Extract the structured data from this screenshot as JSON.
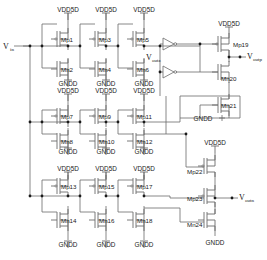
{
  "figure": {
    "type": "circuit-schematic",
    "line_color": "#6b6b6b",
    "text_color": "#1a1a1a",
    "background": "#ffffff"
  },
  "ports": {
    "input": {
      "base": "V",
      "sub": "in",
      "full": "Vin"
    },
    "out_z": {
      "base": "V",
      "sub": "outz",
      "full": "Voutz"
    },
    "out_p": {
      "base": "V",
      "sub": "outp",
      "full": "Voutp"
    },
    "out_n": {
      "base": "V",
      "sub": "outn",
      "full": "Voutn"
    }
  },
  "rails": {
    "supply": "VDD5D",
    "ground": "GNDD"
  },
  "rail_labels": {
    "vdd": [
      {
        "id": "vdd-r1c1",
        "text": "VDD5D",
        "x": 54,
        "y": 17
      },
      {
        "id": "vdd-r1c2",
        "text": "VDD5D",
        "x": 92,
        "y": 17
      },
      {
        "id": "vdd-r1c3",
        "text": "VDD5D",
        "x": 130,
        "y": 17
      },
      {
        "id": "vdd-r2c1",
        "text": "VDD5D",
        "x": 54,
        "y": 98
      },
      {
        "id": "vdd-r2c2",
        "text": "VDD5D",
        "x": 92,
        "y": 98
      },
      {
        "id": "vdd-r2c3",
        "text": "VDD5D",
        "x": 130,
        "y": 98
      },
      {
        "id": "vdd-r3c1",
        "text": "VDD5D",
        "x": 54,
        "y": 165
      },
      {
        "id": "vdd-r3c2",
        "text": "VDD5D",
        "x": 92,
        "y": 165
      },
      {
        "id": "vdd-r3c3",
        "text": "VDD5D",
        "x": 130,
        "y": 165
      },
      {
        "id": "vdd-out1",
        "text": "VDD5D",
        "x": 225,
        "y": 27
      },
      {
        "id": "vdd-out2",
        "text": "VDD5D",
        "x": 225,
        "y": 146
      }
    ],
    "gnd": [
      {
        "id": "gnd-r1c1",
        "text": "GNDD",
        "x": 55,
        "y": 87
      },
      {
        "id": "gnd-r1c2",
        "text": "GNDD",
        "x": 93,
        "y": 87
      },
      {
        "id": "gnd-r1c3",
        "text": "GNDD",
        "x": 131,
        "y": 87
      },
      {
        "id": "gnd-r2c1",
        "text": "GNDD",
        "x": 55,
        "y": 155
      },
      {
        "id": "gnd-r2c2",
        "text": "GNDD",
        "x": 93,
        "y": 155
      },
      {
        "id": "gnd-r2c3",
        "text": "GNDD",
        "x": 131,
        "y": 155
      },
      {
        "id": "gnd-r3c1",
        "text": "GNDD",
        "x": 55,
        "y": 248
      },
      {
        "id": "gnd-r3c2",
        "text": "GNDD",
        "x": 93,
        "y": 248
      },
      {
        "id": "gnd-r3c3",
        "text": "GNDD",
        "x": 131,
        "y": 248
      },
      {
        "id": "gnd-out1",
        "text": "GNDD",
        "x": 204,
        "y": 120
      },
      {
        "id": "gnd-out2",
        "text": "GNDD",
        "x": 221,
        "y": 234
      }
    ]
  },
  "transistors": [
    {
      "id": "Mp1",
      "label": "Mp1",
      "type": "pmos",
      "lx": 61,
      "ly": 40
    },
    {
      "id": "Mn2",
      "label": "Mn2",
      "type": "nmos",
      "lx": 61,
      "ly": 70
    },
    {
      "id": "Mp3",
      "label": "Mp3",
      "type": "pmos",
      "lx": 99,
      "ly": 40
    },
    {
      "id": "Mn4",
      "label": "Mn4",
      "type": "nmos",
      "lx": 99,
      "ly": 70
    },
    {
      "id": "Mp5",
      "label": "Mp5",
      "type": "pmos",
      "lx": 137,
      "ly": 40
    },
    {
      "id": "Mn6",
      "label": "Mn6",
      "type": "nmos",
      "lx": 137,
      "ly": 70
    },
    {
      "id": "Mp7",
      "label": "Mp7",
      "type": "pmos",
      "lx": 61,
      "ly": 118
    },
    {
      "id": "Mn8",
      "label": "Mn8",
      "type": "nmos",
      "lx": 61,
      "ly": 142
    },
    {
      "id": "Mp9",
      "label": "Mp9",
      "type": "pmos",
      "lx": 99,
      "ly": 118
    },
    {
      "id": "Mn10",
      "label": "Mn10",
      "type": "nmos",
      "lx": 99,
      "ly": 142
    },
    {
      "id": "Mp11",
      "label": "Mp11",
      "type": "pmos",
      "lx": 137,
      "ly": 118
    },
    {
      "id": "Mn12",
      "label": "Mn12",
      "type": "nmos",
      "lx": 137,
      "ly": 142
    },
    {
      "id": "Mp13",
      "label": "Mp13",
      "type": "pmos",
      "lx": 61,
      "ly": 188
    },
    {
      "id": "Mn14",
      "label": "Mn14",
      "type": "nmos",
      "lx": 61,
      "ly": 222
    },
    {
      "id": "Mp15",
      "label": "Mp15",
      "type": "pmos",
      "lx": 99,
      "ly": 188
    },
    {
      "id": "Mn16",
      "label": "Mn16",
      "type": "nmos",
      "lx": 99,
      "ly": 222
    },
    {
      "id": "Mp17",
      "label": "Mp17",
      "type": "pmos",
      "lx": 137,
      "ly": 188
    },
    {
      "id": "Mn18",
      "label": "Mn18",
      "type": "nmos",
      "lx": 137,
      "ly": 222
    },
    {
      "id": "Mp19",
      "label": "Mp19",
      "type": "pmos",
      "lx": 224,
      "ly": 45
    },
    {
      "id": "Mn20",
      "label": "Mn20",
      "type": "nmos",
      "lx": 224,
      "ly": 78
    },
    {
      "id": "Mn21",
      "label": "Mn21",
      "type": "nmos",
      "lx": 224,
      "ly": 105
    },
    {
      "id": "Mp22",
      "label": "Mp22",
      "type": "pmos",
      "lx": 210,
      "ly": 167
    },
    {
      "id": "Mp23",
      "label": "Mp23",
      "type": "pmos",
      "lx": 210,
      "ly": 198
    },
    {
      "id": "Mn24",
      "label": "Mn24",
      "type": "nmos",
      "lx": 210,
      "ly": 222
    }
  ],
  "buffers": [
    {
      "id": "buf-top",
      "x": 163,
      "y": 44
    },
    {
      "id": "buf-bottom",
      "x": 163,
      "y": 72
    }
  ]
}
